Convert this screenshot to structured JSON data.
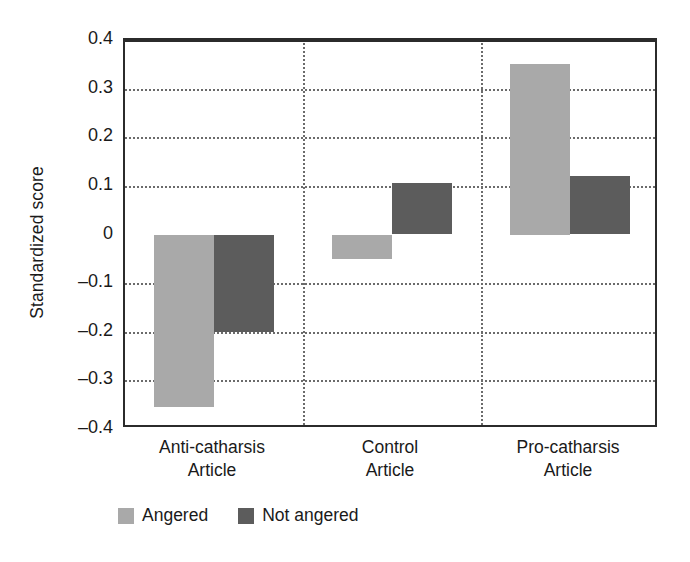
{
  "chart_data": {
    "type": "bar",
    "title": "",
    "subtitle": "",
    "xlabel": "",
    "ylabel": "Standardized score",
    "ylim": [
      -0.4,
      0.4
    ],
    "ytick_labels": [
      "0.4",
      "0.3",
      "0.2",
      "0.1",
      "0",
      "–0.1",
      "–0.2",
      "–0.3",
      "–0.4"
    ],
    "ytick_values": [
      0.4,
      0.3,
      0.2,
      0.1,
      0,
      -0.1,
      -0.2,
      -0.3,
      -0.4
    ],
    "grid": "horizontal-dotted-and-vertical-group-separators",
    "zero_line": true,
    "legend_position": "bottom-left",
    "categories": [
      {
        "line1": "Anti-catharsis",
        "line2": "Article"
      },
      {
        "line1": "Control",
        "line2": "Article"
      },
      {
        "line1": "Pro-catharsis",
        "line2": "Article"
      }
    ],
    "category_labels": [
      "Anti-catharsis Article",
      "Control Article",
      "Pro-catharsis Article"
    ],
    "series": [
      {
        "name": "Angered",
        "color": "#a9a9a9",
        "values": [
          -0.355,
          -0.05,
          0.35
        ]
      },
      {
        "name": "Not angered",
        "color": "#5c5c5c",
        "values": [
          -0.2,
          0.105,
          0.12
        ]
      }
    ]
  },
  "legend": {
    "entries": [
      {
        "label": "Angered",
        "color": "#a9a9a9"
      },
      {
        "label": "Not angered",
        "color": "#5c5c5c"
      }
    ]
  },
  "axes": {
    "y_title": "Standardized score"
  },
  "colors": {
    "angered": "#a9a9a9",
    "not_angered": "#5c5c5c",
    "frame": "#2b2b2b",
    "grid": "#6b6b6b",
    "background": "#ffffff",
    "text": "#1a1a1a"
  }
}
